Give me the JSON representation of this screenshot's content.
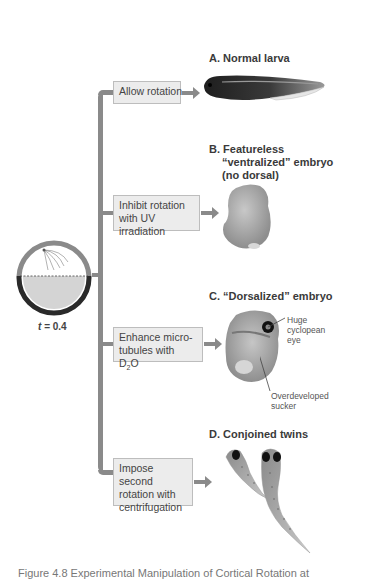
{
  "diagram": {
    "egg": {
      "label": "t = 0.4",
      "t_symbol": "t",
      "t_value": "= 0.4"
    },
    "treatments": [
      {
        "id": "allow",
        "text": "Allow rotation"
      },
      {
        "id": "uv",
        "text": "Inhibit rotation with UV irradiation"
      },
      {
        "id": "d2o",
        "text_prefix": "Enhance micro-",
        "text_line2_a": "tubules with D",
        "subscript": "2",
        "text_line2_b": "O"
      },
      {
        "id": "centrifuge",
        "text": "Impose second rotation with centrifugation"
      }
    ],
    "outcomes": [
      {
        "id": "A",
        "title": "A. Normal larva"
      },
      {
        "id": "B",
        "title_line1": "B. Featureless",
        "title_line2": "“ventralized” embryo",
        "title_line3": "(no dorsal)"
      },
      {
        "id": "C",
        "title": "C. “Dorsalized” embryo",
        "annotations": {
          "eye": "Huge cyclopean eye",
          "sucker": "Overdeveloped sucker"
        }
      },
      {
        "id": "D",
        "title": "D. Conjoined twins"
      }
    ],
    "caption": "Figure 4.8   Experimental Manipulation of Cortical Rotation at"
  },
  "colors": {
    "connector": "#8a8a8a",
    "box_fill": "#ececec",
    "box_border": "#bdbdbd",
    "egg_yolk": "#d4d4d4",
    "egg_shell": "#2a2a2a",
    "text": "#3a3a3a"
  }
}
